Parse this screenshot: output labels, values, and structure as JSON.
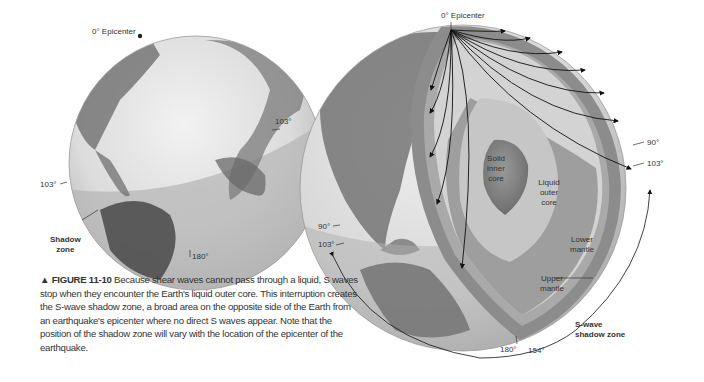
{
  "left_globe": {
    "labels": {
      "epicenter": "0° Epicenter",
      "right_103": "103°",
      "left_103": "103°",
      "shadow_zone": "Shadow\nzone",
      "shadow_zone_line1": "Shadow",
      "shadow_zone_line2": "zone",
      "bottom_180": "180°"
    }
  },
  "right_globe": {
    "labels": {
      "epicenter": "0° Epicenter",
      "right_90": "90°",
      "right_103": "103°",
      "left_90": "90°",
      "left_103": "103°",
      "bottom_180": "180°",
      "bottom_154": "154°",
      "solid_inner_core": [
        "Solid",
        "inner",
        "core"
      ],
      "liquid_outer_core": [
        "Liquid",
        "outer",
        "core"
      ],
      "lower_mantle": [
        "Lower",
        "mantle"
      ],
      "upper_mantle": [
        "Upper",
        "mantle"
      ],
      "s_wave_shadow_zone": [
        "S-wave",
        "shadow zone"
      ]
    }
  },
  "caption": {
    "marker": "▲",
    "figure_label": "FIGURE 11-10",
    "text": "Because shear waves cannot pass through a liquid, S waves stop when they encounter the Earth's liquid outer core. This interruption creates the S-wave shadow zone, a broad area on the opposite side of the Earth from an earthquake's epicenter where no direct S waves appear. Note that the position of the shadow zone will vary with the location of the epicenter of the earthquake."
  },
  "colors": {
    "crust": "#8a8a8a",
    "mantle_upper": "#a5a5a5",
    "mantle_lower": "#b4b4b4",
    "outer_core": "#c9c9c9",
    "inner_core": "#8c8c8c",
    "globe_light": "#e4e4e4",
    "shadow_band": "#bdbdbd"
  }
}
